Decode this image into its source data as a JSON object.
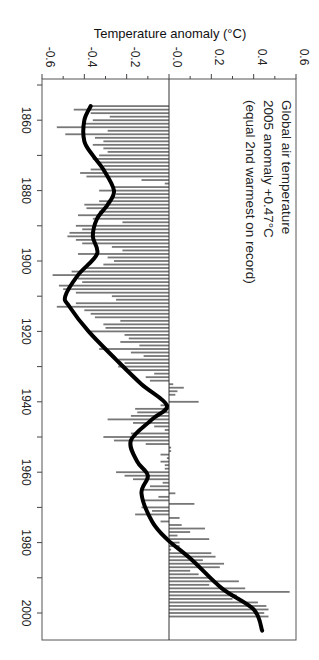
{
  "chart_data": {
    "type": "bar",
    "orientation": "rotated-90-clockwise",
    "title": "",
    "ylabel": "Temperature anomaly (°C)",
    "xlabel": "",
    "ylim": [
      -0.6,
      0.6
    ],
    "xlim": [
      1850,
      2008
    ],
    "y_ticks": [
      -0.6,
      -0.4,
      -0.2,
      0.0,
      0.2,
      0.4,
      0.6
    ],
    "y_tick_labels": [
      "-0.6",
      "-0.4",
      "-0.2",
      "-0.0",
      "0.2",
      "0.4",
      "0.6"
    ],
    "x_ticks": [
      1860,
      1880,
      1900,
      1920,
      1940,
      1960,
      1980,
      2000
    ],
    "x_tick_labels": [
      "1860",
      "1880",
      "1900",
      "1920",
      "1940",
      "1960",
      "1980",
      "2000"
    ],
    "annotation": [
      "Global air temperature",
      "2005 anomaly +0.47°C",
      "(equal 2nd warmest on record)"
    ],
    "legend": "none",
    "grid": false,
    "series": [
      {
        "name": "Annual anomaly",
        "kind": "bar",
        "color": "#777777",
        "x_start": 1856,
        "values": [
          -0.37,
          -0.45,
          -0.37,
          -0.28,
          -0.36,
          -0.41,
          -0.53,
          -0.29,
          -0.49,
          -0.35,
          -0.31,
          -0.36,
          -0.31,
          -0.29,
          -0.33,
          -0.36,
          -0.33,
          -0.31,
          -0.37,
          -0.42,
          -0.39,
          -0.13,
          -0.02,
          -0.27,
          -0.33,
          -0.25,
          -0.26,
          -0.33,
          -0.4,
          -0.39,
          -0.33,
          -0.43,
          -0.36,
          -0.22,
          -0.44,
          -0.41,
          -0.47,
          -0.48,
          -0.44,
          -0.41,
          -0.27,
          -0.22,
          -0.43,
          -0.29,
          -0.26,
          -0.31,
          -0.39,
          -0.46,
          -0.55,
          -0.43,
          -0.41,
          -0.52,
          -0.5,
          -0.44,
          -0.27,
          -0.25,
          -0.44,
          -0.53,
          -0.4,
          -0.37,
          -0.35,
          -0.23,
          -0.31,
          -0.3,
          -0.37,
          -0.21,
          -0.19,
          -0.23,
          -0.14,
          -0.33,
          -0.18,
          -0.12,
          -0.24,
          -0.21,
          -0.24,
          -0.19,
          -0.07,
          -0.11,
          -0.09,
          0.02,
          0.07,
          0.04,
          0.03,
          0.0,
          0.14,
          -0.04,
          -0.16,
          -0.15,
          -0.18,
          -0.29,
          -0.17,
          -0.07,
          -0.02,
          -0.18,
          -0.31,
          -0.26,
          -0.11,
          0.01,
          0.01,
          -0.04,
          -0.01,
          -0.04,
          -0.02,
          -0.02,
          -0.25,
          -0.21,
          -0.17,
          -0.03,
          -0.09,
          -0.13,
          0.03,
          -0.05,
          -0.12,
          0.12,
          -0.13,
          -0.08,
          -0.16,
          0.05,
          -0.04,
          0.06,
          0.17,
          0.1,
          0.04,
          0.19,
          0.05,
          0.05,
          0.01,
          0.2,
          0.22,
          0.16,
          0.26,
          0.24,
          0.1,
          0.14,
          0.2,
          0.33,
          0.19,
          0.36,
          0.57,
          0.32,
          0.3,
          0.42,
          0.46,
          0.47,
          0.45,
          0.47
        ]
      },
      {
        "name": "Smoothed",
        "kind": "line",
        "color": "#000000",
        "points": [
          [
            1856,
            -0.37
          ],
          [
            1860,
            -0.4
          ],
          [
            1866,
            -0.4
          ],
          [
            1870,
            -0.36
          ],
          [
            1874,
            -0.31
          ],
          [
            1880,
            -0.26
          ],
          [
            1884,
            -0.29
          ],
          [
            1888,
            -0.34
          ],
          [
            1893,
            -0.36
          ],
          [
            1898,
            -0.34
          ],
          [
            1904,
            -0.43
          ],
          [
            1910,
            -0.49
          ],
          [
            1913,
            -0.47
          ],
          [
            1920,
            -0.38
          ],
          [
            1928,
            -0.25
          ],
          [
            1935,
            -0.13
          ],
          [
            1941,
            -0.01
          ],
          [
            1945,
            -0.08
          ],
          [
            1951,
            -0.18
          ],
          [
            1957,
            -0.15
          ],
          [
            1961,
            -0.1
          ],
          [
            1966,
            -0.13
          ],
          [
            1974,
            -0.08
          ],
          [
            1979,
            -0.01
          ],
          [
            1985,
            0.11
          ],
          [
            1993,
            0.25
          ],
          [
            1999,
            0.4
          ],
          [
            2005,
            0.44
          ]
        ]
      }
    ]
  }
}
